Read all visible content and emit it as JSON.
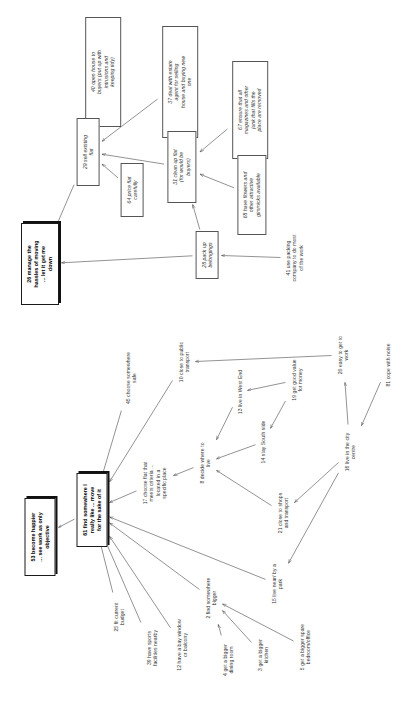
{
  "diagram": {
    "type": "concept-map",
    "orientation": "text-rotated-90-ccw",
    "ink_color": "#333333",
    "accent_color": "#000000",
    "nodes": [
      {
        "id": "n40",
        "label": "40 open house to\nbuyers (put up with\nintrusions and\nkeeping tidy)",
        "style": "boxed",
        "x": 103,
        "y": 72,
        "w": 110,
        "h": 40
      },
      {
        "id": "n37",
        "label": "37 deal with estate\nagent for selling\nhouse and buying new\none",
        "style": "boxed",
        "x": 180,
        "y": 82,
        "w": 112,
        "h": 42
      },
      {
        "id": "n67",
        "label": "67 ensure that all\nmagazines and other\njunk that fills the\nplace are removed",
        "style": "boxed",
        "x": 250,
        "y": 110,
        "w": 98,
        "h": 42
      },
      {
        "id": "n29",
        "label": "29 sell existing\nflat",
        "style": "boxed",
        "x": 88,
        "y": 152,
        "w": 68,
        "h": 25
      },
      {
        "id": "n64",
        "label": "64 price flat\ncarefully",
        "style": "boxed",
        "x": 132,
        "y": 190,
        "w": 54,
        "h": 25
      },
      {
        "id": "n31",
        "label": "31 clean up flat\n(for would be\nbuyers)",
        "style": "boxed",
        "x": 182,
        "y": 167,
        "w": 72,
        "h": 33
      },
      {
        "id": "n68",
        "label": "68 have flowers and\nother attractive\ngimmicks available",
        "style": "boxed",
        "x": 252,
        "y": 195,
        "w": 80,
        "h": 33
      },
      {
        "id": "n28",
        "label": "28 pack up\nbelongings",
        "style": "boxed",
        "x": 207,
        "y": 255,
        "w": 48,
        "h": 26
      },
      {
        "id": "n41",
        "label": "41 use packing\ncompany to do most\nof the work",
        "style": "label",
        "x": 295,
        "y": 258,
        "w": 54,
        "h": 26
      },
      {
        "id": "n26",
        "label": "26 manage the\nhassles of moving\n... let it get me\ndown",
        "style": "goal",
        "x": 40,
        "y": 264,
        "w": 70,
        "h": 40
      },
      {
        "id": "n45",
        "label": "45 choose somewhere\nsafe",
        "style": "label",
        "x": 131,
        "y": 378,
        "w": 62,
        "h": 20
      },
      {
        "id": "n10",
        "label": "10 close to public\ntransport",
        "style": "label",
        "x": 184,
        "y": 362,
        "w": 56,
        "h": 20
      },
      {
        "id": "n13",
        "label": "13 live in West End",
        "style": "label",
        "x": 240,
        "y": 392,
        "w": 58,
        "h": 12
      },
      {
        "id": "n19",
        "label": "19 get good value\nfor money",
        "style": "label",
        "x": 297,
        "y": 380,
        "w": 52,
        "h": 20
      },
      {
        "id": "n20",
        "label": "20 easy to get to\nwork",
        "style": "label",
        "x": 343,
        "y": 355,
        "w": 52,
        "h": 20
      },
      {
        "id": "n81",
        "label": "81 cope with noise",
        "style": "label",
        "x": 388,
        "y": 365,
        "w": 56,
        "h": 12
      },
      {
        "id": "n14",
        "label": "14 stay South side",
        "style": "label",
        "x": 263,
        "y": 442,
        "w": 54,
        "h": 12
      },
      {
        "id": "n16",
        "label": "16 live in the city\ncentre",
        "style": "label",
        "x": 350,
        "y": 452,
        "w": 52,
        "h": 20
      },
      {
        "id": "n8",
        "label": "8 decide where to\nlive",
        "style": "label",
        "x": 205,
        "y": 463,
        "w": 52,
        "h": 20
      },
      {
        "id": "n17",
        "label": "17 choose flat that\nmeets criteria ...\nlocated in a\nspecific place",
        "style": "label",
        "x": 155,
        "y": 483,
        "w": 58,
        "h": 34
      },
      {
        "id": "n21",
        "label": "21 close to shops\nand transport",
        "style": "label",
        "x": 283,
        "y": 513,
        "w": 52,
        "h": 20
      },
      {
        "id": "n61",
        "label": "61 find somewhere I\nreally like ... move\nfor the sake of it",
        "style": "goal",
        "x": 92,
        "y": 510,
        "w": 62,
        "h": 32
      },
      {
        "id": "n53",
        "label": "53 become happier\n... see work as only\nobjective",
        "style": "goal",
        "x": 40,
        "y": 537,
        "w": 66,
        "h": 34
      },
      {
        "id": "n25",
        "label": "25 fit current\nbudget",
        "style": "label",
        "x": 119,
        "y": 617,
        "w": 46,
        "h": 20
      },
      {
        "id": "n39",
        "label": "39 have sports\nfacilities nearby",
        "style": "label",
        "x": 152,
        "y": 648,
        "w": 48,
        "h": 20
      },
      {
        "id": "n12",
        "label": "12 have a bay window\nor balcony",
        "style": "label",
        "x": 182,
        "y": 645,
        "w": 58,
        "h": 20
      },
      {
        "id": "n2",
        "label": "2 find somewhere\nbigger",
        "style": "label",
        "x": 211,
        "y": 598,
        "w": 50,
        "h": 20
      },
      {
        "id": "n4",
        "label": "4 get a bigger\ndining room",
        "style": "label",
        "x": 228,
        "y": 660,
        "w": 46,
        "h": 20
      },
      {
        "id": "n3",
        "label": "3 get a bigger\nkitchen",
        "style": "label",
        "x": 263,
        "y": 655,
        "w": 46,
        "h": 20
      },
      {
        "id": "n5",
        "label": "5 get a bigger spare\nbedroom/office",
        "style": "label",
        "x": 305,
        "y": 647,
        "w": 58,
        "h": 20
      },
      {
        "id": "n15",
        "label": "15 live near/ by a\npark",
        "style": "label",
        "x": 277,
        "y": 584,
        "w": 52,
        "h": 20
      }
    ],
    "edges": [
      {
        "from": "n40",
        "to": "n29"
      },
      {
        "from": "n37",
        "to": "n29"
      },
      {
        "from": "n67",
        "to": "n31"
      },
      {
        "from": "n31",
        "to": "n29"
      },
      {
        "from": "n64",
        "to": "n29"
      },
      {
        "from": "n29",
        "to": "n26"
      },
      {
        "from": "n68",
        "to": "n31"
      },
      {
        "from": "n28",
        "to": "n31"
      },
      {
        "from": "n41",
        "to": "n28"
      },
      {
        "from": "n28",
        "to": "n26"
      },
      {
        "from": "n45",
        "to": "n61"
      },
      {
        "from": "n10",
        "to": "n61"
      },
      {
        "from": "n20",
        "to": "n10"
      },
      {
        "from": "n19",
        "to": "n13"
      },
      {
        "from": "n13",
        "to": "n8"
      },
      {
        "from": "n14",
        "to": "n8"
      },
      {
        "from": "n19",
        "to": "n14"
      },
      {
        "from": "n16",
        "to": "n20"
      },
      {
        "from": "n81",
        "to": "n16"
      },
      {
        "from": "n16",
        "to": "n21"
      },
      {
        "from": "n21",
        "to": "n8"
      },
      {
        "from": "n8",
        "to": "n17"
      },
      {
        "from": "n17",
        "to": "n61"
      },
      {
        "from": "n61",
        "to": "n53"
      },
      {
        "from": "n25",
        "to": "n61"
      },
      {
        "from": "n39",
        "to": "n61"
      },
      {
        "from": "n12",
        "to": "n61"
      },
      {
        "from": "n2",
        "to": "n61"
      },
      {
        "from": "n4",
        "to": "n2"
      },
      {
        "from": "n3",
        "to": "n2"
      },
      {
        "from": "n5",
        "to": "n2"
      },
      {
        "from": "n15",
        "to": "n61"
      },
      {
        "from": "n16",
        "to": "n15"
      }
    ]
  }
}
